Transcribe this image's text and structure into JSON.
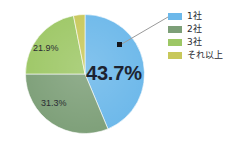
{
  "chart_data": {
    "type": "pie",
    "title": "",
    "subtitle": "",
    "xlabel": "",
    "ylabel": "",
    "grid": false,
    "legend_position": "right",
    "unit": "%",
    "categories": [
      "1社",
      "2社",
      "3社",
      "それ以上"
    ],
    "values": [
      43.7,
      31.3,
      21.9,
      3.1
    ],
    "colors": [
      "#6cb8ea",
      "#7d9f78",
      "#9dc765",
      "#c8c85a"
    ],
    "slices": [
      {
        "label": "1社",
        "value": 43.7,
        "display": "43.7%",
        "color": "#6cb8ea",
        "label_shown": true,
        "emphasis": true,
        "callout": true
      },
      {
        "label": "2社",
        "value": 31.3,
        "display": "31.3%",
        "color": "#7d9f78",
        "label_shown": true,
        "emphasis": false,
        "callout": false
      },
      {
        "label": "3社",
        "value": 21.9,
        "display": "21.9%",
        "color": "#9dc765",
        "label_shown": true,
        "emphasis": false,
        "callout": false
      },
      {
        "label": "それ以上",
        "value": 3.1,
        "display": "",
        "color": "#c8c85a",
        "label_shown": false,
        "emphasis": false,
        "callout": false
      }
    ]
  },
  "legend": {
    "items": [
      {
        "label": "1社",
        "color": "#6cb8ea"
      },
      {
        "label": "2社",
        "color": "#7d9f78"
      },
      {
        "label": "3社",
        "color": "#9dc765"
      },
      {
        "label": "それ以上",
        "color": "#c8c85a"
      }
    ]
  },
  "callout": {
    "marker_color": "#15161c",
    "line_color": "#9a9a9a"
  },
  "style": {
    "background": "#ffffff",
    "label_color": "#24252b"
  }
}
